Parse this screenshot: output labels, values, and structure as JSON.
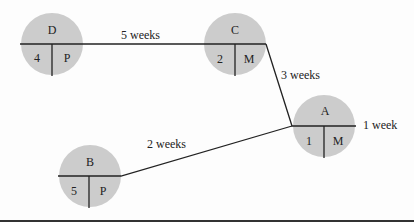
{
  "diagram": {
    "type": "activity-on-node network",
    "nodes": [
      {
        "id": "D",
        "name": "D",
        "duration": "4",
        "owner": "P"
      },
      {
        "id": "C",
        "name": "C",
        "duration": "2",
        "owner": "M"
      },
      {
        "id": "A",
        "name": "A",
        "duration": "1",
        "owner": "M"
      },
      {
        "id": "B",
        "name": "B",
        "duration": "5",
        "owner": "P"
      }
    ],
    "edges": [
      {
        "from": "D",
        "to": "C",
        "label": "5 weeks"
      },
      {
        "from": "C",
        "to": "A",
        "label": "3 weeks"
      },
      {
        "from": "B",
        "to": "A",
        "label": "2 weeks"
      },
      {
        "from": "A",
        "to": "end",
        "label": "1 week"
      }
    ],
    "colors": {
      "node_fill": "#cccccc",
      "line": "#222222"
    }
  }
}
